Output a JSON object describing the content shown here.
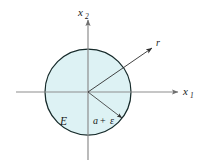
{
  "figure": {
    "title": "",
    "type": "geometric-diagram",
    "colors": {
      "disk_fill": "#ddf2f4",
      "disk_stroke": "#1a2b2b",
      "axis": "#8a8a8a",
      "arrow": "#3a3a3a",
      "text": "#1a1a1a",
      "background": "#ffffff"
    },
    "axes": {
      "horizontal": {
        "label": "x",
        "subscript": "1",
        "name": "x1-axis"
      },
      "vertical": {
        "label": "x",
        "subscript": "2",
        "name": "x2-axis"
      }
    },
    "labels": {
      "region": "E",
      "radius_a": "a",
      "radius_plus": "+",
      "radius_epsilon": "ε",
      "radial_direction": "r"
    },
    "geometry": {
      "center_x": 88,
      "center_y": 92,
      "radius": 43,
      "r_arrow_angle_deg": 34,
      "radius_arrow_angle_deg": -38
    }
  }
}
